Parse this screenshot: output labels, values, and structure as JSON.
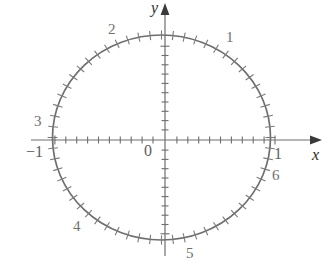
{
  "figure": {
    "background_color": "#ffffff",
    "curve_color": "#6e6e6e",
    "axis_color": "#6e6e6e",
    "label_color": "#707070"
  },
  "axes": {
    "x_axis_label": "x",
    "y_axis_label": "y",
    "origin_label": "0",
    "x_tick_labels": [
      {
        "text": "−1",
        "value": -1
      },
      {
        "text": "1",
        "value": 1
      }
    ],
    "x_range": [
      -1.38,
      1.42
    ],
    "y_range": [
      -1.18,
      1.3
    ],
    "minor_tick_step": 0.1,
    "grid": false
  },
  "arc_markers": [
    {
      "label": "1",
      "arc_length": 1
    },
    {
      "label": "2",
      "arc_length": 2
    },
    {
      "label": "3",
      "arc_length": 3
    },
    {
      "label": "4",
      "arc_length": 4
    },
    {
      "label": "5",
      "arc_length": 5
    },
    {
      "label": "6",
      "arc_length": 6
    }
  ],
  "chart_data": {
    "type": "line",
    "xlabel": "x",
    "ylabel": "y",
    "xlim": [
      -1.38,
      1.42
    ],
    "ylim": [
      -1.18,
      1.3
    ],
    "grid": false,
    "legend": "none",
    "series": [
      {
        "name": "unit circle",
        "shape": "circle",
        "center": [
          0,
          0
        ],
        "radius": 1,
        "tick_count": 60,
        "tick_spacing_radians": 0.10471975512
      }
    ],
    "annotations": [
      {
        "text": "1",
        "x": 0.54,
        "y": 0.84,
        "note": "arc length s = 1 rad position"
      },
      {
        "text": "2",
        "x": -0.42,
        "y": 0.91,
        "note": "arc length s = 2 rad position"
      },
      {
        "text": "3",
        "x": -0.99,
        "y": 0.14,
        "note": "arc length s = 3 rad position"
      },
      {
        "text": "4",
        "x": -0.65,
        "y": -0.76,
        "note": "arc length s = 4 rad position"
      },
      {
        "text": "5",
        "x": 0.28,
        "y": -0.96,
        "note": "arc length s = 5 rad position"
      },
      {
        "text": "6",
        "x": 0.96,
        "y": -0.28,
        "note": "arc length s = 6 rad position"
      },
      {
        "text": "0",
        "x": 0,
        "y": 0,
        "note": "origin"
      },
      {
        "text": "−1",
        "x": -1,
        "y": 0,
        "note": "x = -1 tick label"
      },
      {
        "text": "1",
        "x": 1,
        "y": 0,
        "note": "x = 1 tick label"
      }
    ]
  }
}
